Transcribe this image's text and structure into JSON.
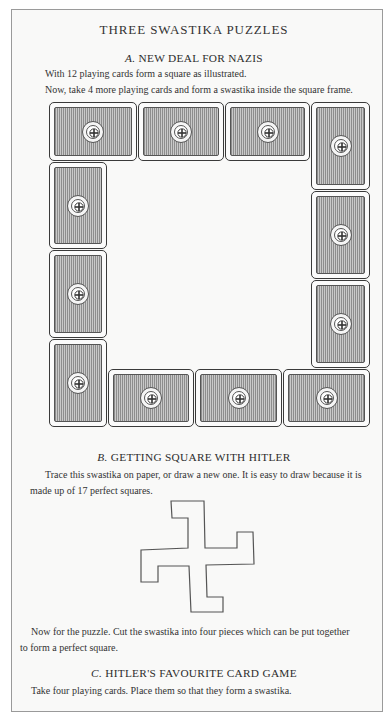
{
  "page": {
    "title": "THREE SWASTIKA PUZZLES",
    "frame_border_color": "#9a9a9a"
  },
  "section_a": {
    "letter": "A.",
    "heading": "NEW DEAL FOR NAZIS",
    "lines": [
      "With 12 playing cards form a square as illustrated.",
      "Now, take 4 more playing cards and form a swastika inside the square frame."
    ],
    "illustration": {
      "description": "12 playing cards (face down) arranged as a square frame",
      "card_count": 12,
      "cards": [
        {
          "orientation": "horizontal",
          "x": 49,
          "y": 102,
          "w": 88,
          "h": 59
        },
        {
          "orientation": "horizontal",
          "x": 138,
          "y": 102,
          "w": 86,
          "h": 59
        },
        {
          "orientation": "horizontal",
          "x": 225,
          "y": 102,
          "w": 85,
          "h": 59
        },
        {
          "orientation": "vertical",
          "x": 311,
          "y": 102,
          "w": 59,
          "h": 88
        },
        {
          "orientation": "vertical",
          "x": 311,
          "y": 191,
          "w": 59,
          "h": 88
        },
        {
          "orientation": "vertical",
          "x": 311,
          "y": 280,
          "w": 59,
          "h": 88
        },
        {
          "orientation": "vertical",
          "x": 49,
          "y": 162,
          "w": 58,
          "h": 87
        },
        {
          "orientation": "vertical",
          "x": 49,
          "y": 250,
          "w": 58,
          "h": 88
        },
        {
          "orientation": "vertical",
          "x": 49,
          "y": 339,
          "w": 58,
          "h": 88
        },
        {
          "orientation": "horizontal",
          "x": 108,
          "y": 369,
          "w": 86,
          "h": 58
        },
        {
          "orientation": "horizontal",
          "x": 195,
          "y": 369,
          "w": 87,
          "h": 58
        },
        {
          "orientation": "horizontal",
          "x": 283,
          "y": 369,
          "w": 87,
          "h": 58
        }
      ]
    }
  },
  "section_b": {
    "letter": "B.",
    "heading": "GETTING SQUARE WITH HITLER",
    "intro_line1": "Trace this swastika on paper, or draw a new one. It is easy to draw because it is",
    "intro_line2": "made up of 17 perfect squares.",
    "puzzle_line1": "Now for the puzzle. Cut the swastika into four pieces which can be put together",
    "puzzle_line2": "to form a perfect square.",
    "figure_points": "171,501 204,501 205,548 237,548 237,532 253,532 254,564 206,565 207,597 223,597 223,612 191,612 189,566 158,566 158,582 141,582 141,550 188,548 188,518 172,518"
  },
  "section_c": {
    "letter": "C.",
    "heading": "HITLER'S FAVOURITE CARD GAME",
    "line": "Take four playing cards. Place them so that they form a swastika."
  }
}
